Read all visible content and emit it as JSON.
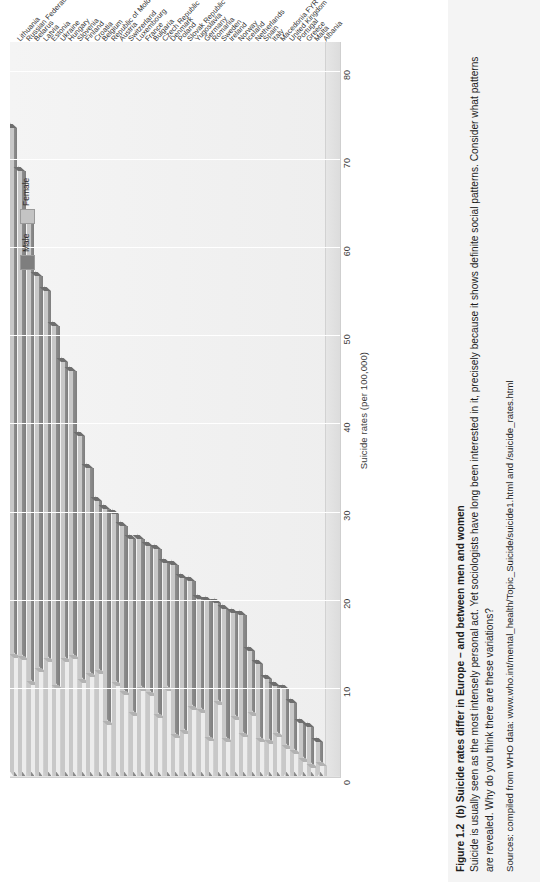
{
  "figure": {
    "caption_label": "Figure 1.2",
    "caption_title": "(b) Suicide rates differ in Europe – and between men and women",
    "caption_body_1": "Suicide is usually seen as the most intensely personal act. Yet sociologists have long been interested in it, precisely because it shows definite social patterns. Consider what patterns",
    "caption_body_2": "are revealed. Why do you think there are these variations?",
    "caption_sources": "Sources: compiled from WHO data: www.who.int/mental_health/Topic_Suicide/suicide1.html and /suicide_rates.html"
  },
  "legend": {
    "items": [
      {
        "label": "Male",
        "color": "#7e7e7e"
      },
      {
        "label": "Female",
        "color": "#c4c4c4"
      }
    ]
  },
  "chart_data": {
    "type": "bar",
    "orientation": "horizontal-3d",
    "title": "",
    "xlabel": "",
    "ylabel": "Suicide rates (per 100,000)",
    "ylim": [
      0,
      80
    ],
    "yticks": [
      0,
      10,
      20,
      30,
      40,
      50,
      60,
      70,
      80
    ],
    "grid": true,
    "legend_position": "top-right",
    "categories": [
      "Lithuania",
      "Russian Federation",
      "Belarus",
      "Latvia",
      "Estonia",
      "Ukraine",
      "Hungary",
      "Slovenia",
      "Finland",
      "Croatia",
      "Belgium",
      "Republic of Moldova",
      "Austria",
      "Switzerland",
      "Luxembourg",
      "France",
      "Bulgaria",
      "Czech Republic",
      "Denmark",
      "Poland",
      "Slovak Republic",
      "Yugoslavia",
      "Germany",
      "Romania",
      "Sweden",
      "Ireland",
      "Norway",
      "Iceland",
      "Netherlands",
      "Spain",
      "Italy",
      "Macedonia FYR",
      "United Kingdom",
      "Portugal",
      "Greece",
      "Malta",
      "Albania"
    ],
    "series": [
      {
        "name": "Male",
        "color": "#7e7e7e",
        "values": [
          73.7,
          68.8,
          63.1,
          56.8,
          55.2,
          51.2,
          47.1,
          46.1,
          38.7,
          35.1,
          31.3,
          30.4,
          29.9,
          28.5,
          27.0,
          27.0,
          26.2,
          25.9,
          24.3,
          24.1,
          22.6,
          22.2,
          20.2,
          20.0,
          19.7,
          19.1,
          18.6,
          18.4,
          14.3,
          12.8,
          11.1,
          10.3,
          10.0,
          8.4,
          6.1,
          5.7,
          4.0
        ]
      },
      {
        "name": "Female",
        "color": "#c4c4c4",
        "values": [
          13.5,
          13.3,
          10.4,
          11.9,
          13.1,
          10.0,
          13.0,
          13.4,
          10.7,
          11.3,
          11.7,
          5.9,
          10.3,
          9.3,
          6.9,
          9.8,
          9.2,
          6.7,
          9.8,
          4.4,
          4.9,
          7.6,
          7.3,
          4.1,
          8.2,
          4.0,
          6.5,
          4.5,
          6.9,
          4.0,
          3.8,
          4.5,
          3.2,
          2.6,
          1.7,
          1.0,
          1.3
        ]
      }
    ]
  }
}
